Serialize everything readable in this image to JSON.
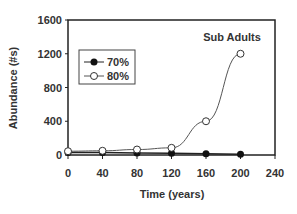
{
  "chart_data": {
    "type": "line",
    "title": "Sub Adults",
    "xlabel": "Time (years)",
    "ylabel": "Abundance (#s)",
    "x": [
      0,
      40,
      80,
      120,
      160,
      200
    ],
    "xlim": [
      0,
      240
    ],
    "ylim": [
      0,
      1600
    ],
    "xticks": [
      0,
      40,
      80,
      120,
      160,
      200,
      240
    ],
    "yticks": [
      0,
      400,
      800,
      1200,
      1600
    ],
    "grid": false,
    "legend_position": "upper-left",
    "series": [
      {
        "name": "70%",
        "marker": "filled-circle",
        "values": [
          30,
          30,
          25,
          20,
          15,
          10
        ]
      },
      {
        "name": "80%",
        "marker": "open-circle",
        "values": [
          45,
          50,
          65,
          85,
          400,
          1200
        ]
      }
    ]
  }
}
